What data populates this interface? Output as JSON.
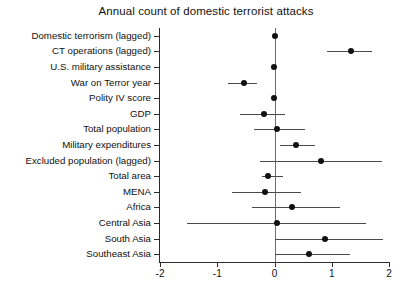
{
  "chart_data": {
    "type": "scatter",
    "title": "Annual count of domestic terrorist attacks",
    "xlabel": "",
    "ylabel": "",
    "xlim": [
      -2,
      2
    ],
    "xticks": [
      -2,
      -1,
      0,
      1,
      2
    ],
    "xtick_labels": [
      "-2",
      "-1",
      "0",
      "1",
      "2"
    ],
    "grid": false,
    "legend": null,
    "reference_line": 0,
    "categories": [
      "Domestic terrorism (lagged)",
      "CT operations (lagged)",
      "U.S. military assistance",
      "War on Terror year",
      "Polity IV score",
      "GDP",
      "Total population",
      "Military expenditures",
      "Excluded population (lagged)",
      "Total area",
      "MENA",
      "Africa",
      "Central Asia",
      "South Asia",
      "Southeast Asia"
    ],
    "series": [
      {
        "name": "coefficient estimate",
        "values": [
          0.0,
          1.33,
          -0.01,
          -0.54,
          -0.01,
          -0.19,
          0.04,
          0.37,
          0.82,
          -0.11,
          -0.16,
          0.3,
          0.04,
          0.88,
          0.61
        ],
        "ci_low": [
          -0.02,
          0.91,
          -0.05,
          -0.82,
          -0.05,
          -0.61,
          -0.35,
          0.09,
          -0.26,
          -0.21,
          -0.75,
          -0.4,
          -1.53,
          0.0,
          0.0
        ],
        "ci_high": [
          0.02,
          1.7,
          0.03,
          -0.3,
          0.03,
          0.19,
          0.53,
          0.7,
          1.88,
          0.14,
          0.47,
          1.14,
          1.6,
          1.89,
          1.32
        ]
      }
    ]
  },
  "colors": {
    "point": "#111111",
    "ci_bar": "#4a4a4a",
    "zero_line": "#6f6f6f",
    "axis": "#2b2b2b",
    "background": "#ffffff"
  }
}
